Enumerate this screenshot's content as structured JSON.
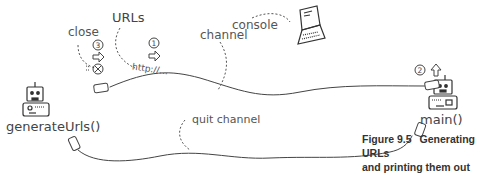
{
  "diagram": {
    "labels": {
      "close": "close",
      "urls": "URLs",
      "channel": "channel",
      "console": "console",
      "quit_channel": "quit channel",
      "generate_urls": "generateUrls()",
      "main": "main()",
      "url_text": "http://..."
    },
    "steps": [
      "1",
      "2",
      "3"
    ],
    "icons": [
      "robot-icon",
      "laptop-icon",
      "plug-icon",
      "close-x-icon",
      "right-arrow-icon",
      "up-arrow-icon"
    ]
  },
  "caption": {
    "number": "Figure 9.5",
    "line1": "Generating URLs",
    "line2": "and printing them out"
  }
}
